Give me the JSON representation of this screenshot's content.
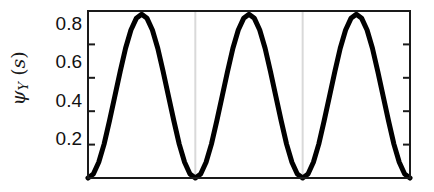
{
  "chart_data": {
    "type": "line",
    "title": "",
    "xlabel": "",
    "ylabel": "psi_Y (s)",
    "ylabel_parts": {
      "symbol": "ψ",
      "subscript": "Y",
      "arg": "(s)"
    },
    "ylim": [
      0,
      1.0
    ],
    "xlim": [
      0,
      3
    ],
    "yticks": [
      0.2,
      0.4,
      0.6,
      0.8
    ],
    "ytick_labels": [
      "0.2",
      "0.4",
      "0.6",
      "0.8"
    ],
    "xticks": [],
    "xtick_labels": [],
    "grid": "vertical-only",
    "gridline_x": [
      1,
      2
    ],
    "gridline_color": "#d9d9d9",
    "legend": null,
    "line_color": "#000000",
    "line_width_px": 5,
    "frame_color": "#1a1a1a",
    "background": "#ffffff",
    "series": [
      {
        "name": "psi_Y(s)",
        "formula": "0.49*(1-cos(2*pi*x))",
        "x": [
          0,
          0.05,
          0.1,
          0.15,
          0.2,
          0.25,
          0.3,
          0.35,
          0.4,
          0.45,
          0.5,
          0.55,
          0.6,
          0.65,
          0.7,
          0.75,
          0.8,
          0.85,
          0.9,
          0.95,
          1.0,
          1.05,
          1.1,
          1.15,
          1.2,
          1.25,
          1.3,
          1.35,
          1.4,
          1.45,
          1.5,
          1.55,
          1.6,
          1.65,
          1.7,
          1.75,
          1.8,
          1.85,
          1.9,
          1.95,
          2.0,
          2.05,
          2.1,
          2.15,
          2.2,
          2.25,
          2.3,
          2.35,
          2.4,
          2.45,
          2.5,
          2.55,
          2.6,
          2.65,
          2.7,
          2.75,
          2.8,
          2.85,
          2.9,
          2.95,
          3.0
        ],
        "y": [
          0.0,
          0.024,
          0.094,
          0.203,
          0.342,
          0.49,
          0.638,
          0.777,
          0.886,
          0.956,
          0.98,
          0.956,
          0.886,
          0.777,
          0.638,
          0.49,
          0.342,
          0.203,
          0.094,
          0.024,
          0.0,
          0.024,
          0.094,
          0.203,
          0.342,
          0.49,
          0.638,
          0.777,
          0.886,
          0.956,
          0.98,
          0.956,
          0.886,
          0.777,
          0.638,
          0.49,
          0.342,
          0.203,
          0.094,
          0.024,
          0.0,
          0.024,
          0.094,
          0.203,
          0.342,
          0.49,
          0.638,
          0.777,
          0.886,
          0.956,
          0.98,
          0.956,
          0.886,
          0.777,
          0.638,
          0.49,
          0.342,
          0.203,
          0.094,
          0.024,
          0.0
        ]
      }
    ]
  }
}
